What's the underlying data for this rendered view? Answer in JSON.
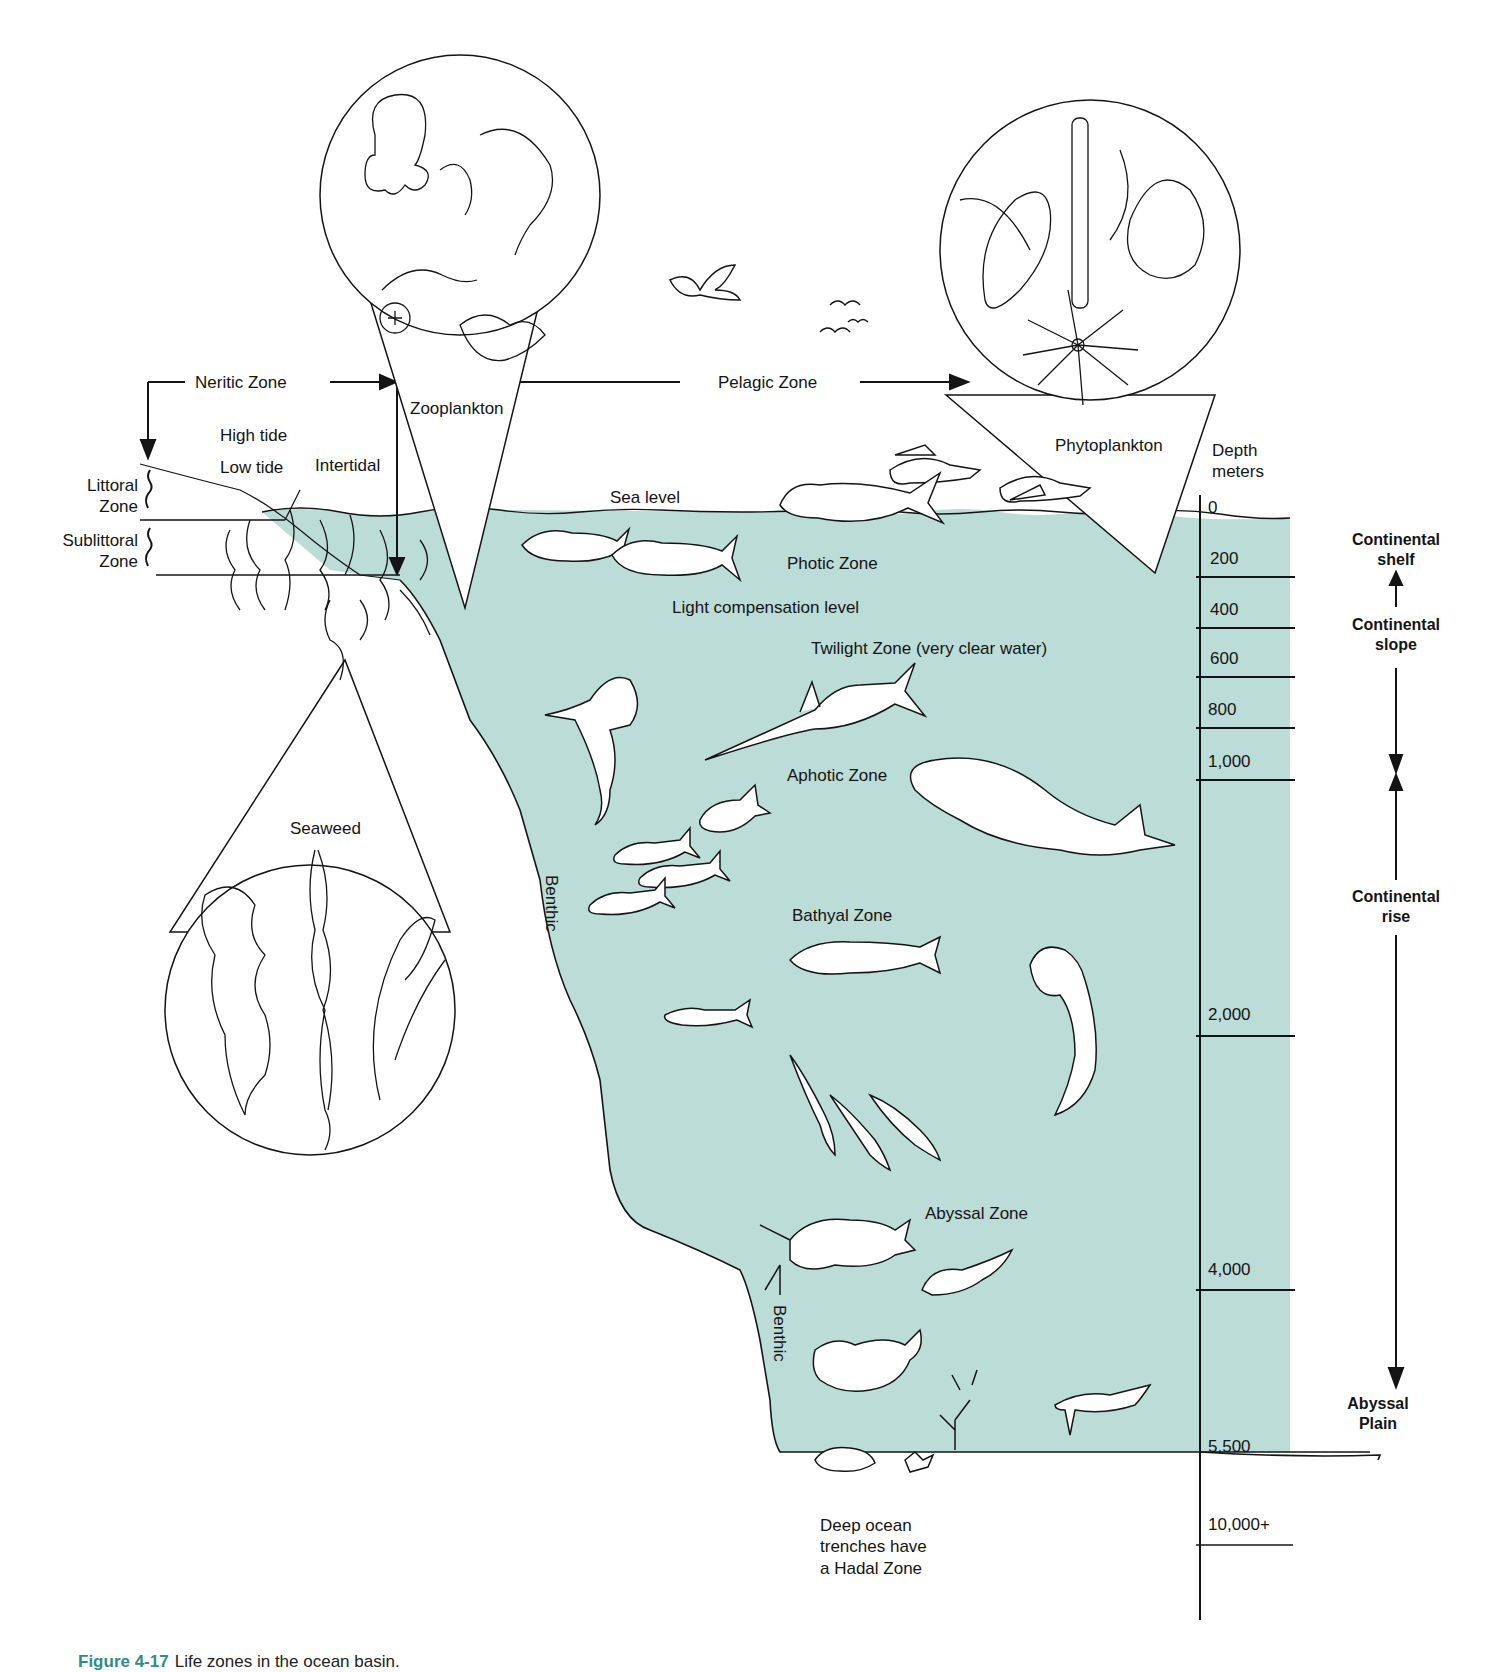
{
  "colors": {
    "water": "#bcdcd8",
    "ink": "#141414",
    "caption_accent": "#2e8d86",
    "background": "#ffffff"
  },
  "caption": {
    "figure_number": "Figure 4-17",
    "text": "Life zones in the ocean basin."
  },
  "top_labels": {
    "neritic_zone": "Neritic Zone",
    "pelagic_zone": "Pelagic Zone",
    "zooplankton": "Zooplankton",
    "phytoplankton": "Phytoplankton",
    "high_tide": "High tide",
    "low_tide": "Low tide",
    "intertidal": "Intertidal",
    "sea_level": "Sea level"
  },
  "shore_zones": {
    "littoral": [
      "Littoral",
      "Zone"
    ],
    "sublittoral": [
      "Sublittoral",
      "Zone"
    ]
  },
  "inset_labels": {
    "seaweed": "Seaweed"
  },
  "water_zones": {
    "photic": "Photic Zone",
    "light_compensation": "Light compensation level",
    "twilight": "Twilight Zone (very clear water)",
    "aphotic": "Aphotic Zone",
    "bathyal": "Bathyal Zone",
    "abyssal": "Abyssal Zone",
    "benthic_upper": "Benthic",
    "benthic_lower": "Benthic",
    "hadal_note": [
      "Deep ocean",
      "trenches have",
      "a Hadal Zone"
    ]
  },
  "depth_scale": {
    "title": [
      "Depth",
      "meters"
    ],
    "ticks": [
      "0",
      "200",
      "400",
      "600",
      "800",
      "1,000",
      "2,000",
      "4,000",
      "5,500",
      "10,000+"
    ]
  },
  "seafloor_regions": {
    "continental_shelf": [
      "Continental",
      "shelf"
    ],
    "continental_slope": [
      "Continental",
      "slope"
    ],
    "continental_rise": [
      "Continental",
      "rise"
    ],
    "abyssal_plain": [
      "Abyssal",
      "Plain"
    ]
  },
  "illustrations": [
    "zooplankton-inset-circle",
    "phytoplankton-inset-circle",
    "seaweed-inset-circle",
    "seagull-icon",
    "distant-birds-icon",
    "flying-fish-icon",
    "dolphinfish-icon",
    "tuna-icon",
    "shark-icon",
    "swordfish-icon",
    "sperm-whale-icon",
    "fish-school-icon",
    "viperfish-icon",
    "squid-icon",
    "anglerfish-icon",
    "crab-icon",
    "sea-star-icon",
    "coral-icon"
  ]
}
